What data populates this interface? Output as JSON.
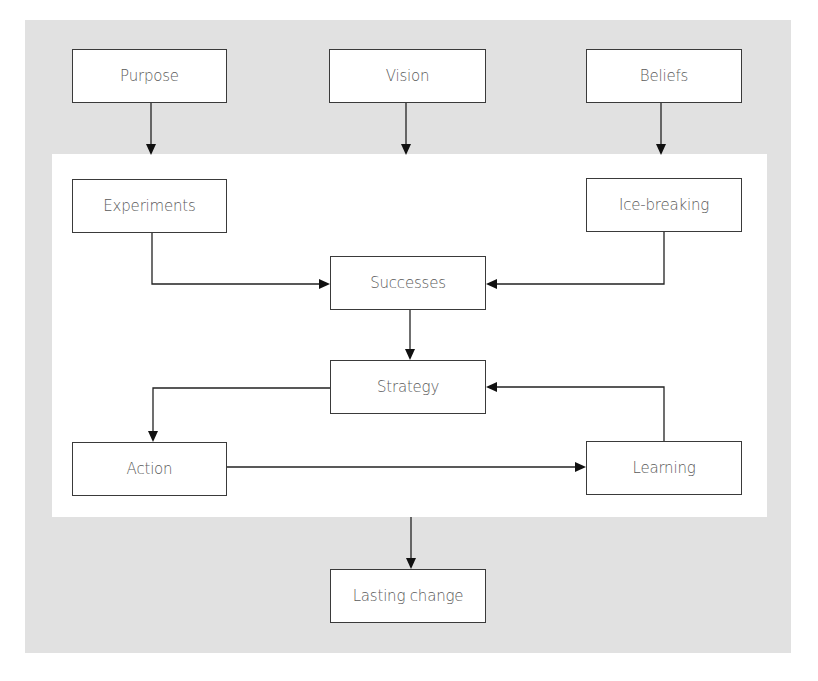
{
  "diagram": {
    "type": "flowchart",
    "colors": {
      "outer_background": "#e1e1e1",
      "inner_background": "#ffffff",
      "node_border": "#3a3a3a",
      "node_text": "#5a5a5a",
      "arrow": "#222222"
    },
    "nodes": {
      "purpose": "Purpose",
      "vision": "Vision",
      "beliefs": "Beliefs",
      "experiments": "Experiments",
      "ice_breaking": "Ice-breaking",
      "successes": "Successes",
      "strategy": "Strategy",
      "action": "Action",
      "learning": "Learning",
      "lasting_change": "Lasting change"
    },
    "edges": [
      {
        "from": "Purpose",
        "to": "inner-panel"
      },
      {
        "from": "Vision",
        "to": "inner-panel"
      },
      {
        "from": "Beliefs",
        "to": "inner-panel"
      },
      {
        "from": "Experiments",
        "to": "Successes"
      },
      {
        "from": "Ice-breaking",
        "to": "Successes"
      },
      {
        "from": "Successes",
        "to": "Strategy"
      },
      {
        "from": "Strategy",
        "to": "Action"
      },
      {
        "from": "Action",
        "to": "Learning"
      },
      {
        "from": "Learning",
        "to": "Strategy"
      },
      {
        "from": "inner-panel",
        "to": "Lasting change"
      }
    ]
  }
}
